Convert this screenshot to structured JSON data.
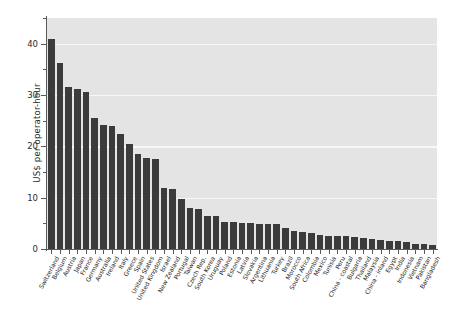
{
  "chart_data": {
    "type": "bar",
    "title": "",
    "subtitle": "",
    "xlabel": "",
    "ylabel": "US$ per operator-hour",
    "ylim": [
      0,
      45
    ],
    "yticks": [
      0,
      10,
      20,
      30,
      40
    ],
    "ytick_labels": [
      "0",
      "10",
      "20",
      "30",
      "40"
    ],
    "yminor_ticks": [
      5,
      15,
      25,
      35,
      45
    ],
    "gridlines": [
      10,
      20,
      30,
      40
    ],
    "grid": true,
    "legend": null,
    "bar_color": "#3b3b3b",
    "plot_background": "#e4e4e4",
    "gridline_color": "#f7f7f7",
    "categories": [
      "Switzerland",
      "Belgium",
      "Austria",
      "Japan",
      "France",
      "Germany",
      "Australia",
      "Ireland",
      "Italy",
      "Greece",
      "Spain",
      "United States",
      "United Kingdom",
      "Israel",
      "New Zealand",
      "Portugal",
      "Taiwan",
      "Czech Rep.",
      "South Korea",
      "Uruguay",
      "Poland",
      "Estonia",
      "Latvia",
      "Slovakia",
      "Argentina",
      "Lithuania",
      "Turkey",
      "Brazil",
      "Morocco",
      "South Africa",
      "Colombia",
      "Mexico",
      "Tunisia",
      "Peru",
      "China - coastal",
      "Bulgaria",
      "Thailand",
      "Malaysia",
      "China - inland",
      "Egypt",
      "India",
      "Indonesia",
      "Vietnam",
      "Pakistan",
      "Bangladesh"
    ],
    "values": [
      41.0,
      36.3,
      31.5,
      31.1,
      30.6,
      25.5,
      24.1,
      24.0,
      22.5,
      20.4,
      18.5,
      17.8,
      17.5,
      11.8,
      11.7,
      9.8,
      8.0,
      7.7,
      6.5,
      6.4,
      5.2,
      5.2,
      5.1,
      5.0,
      4.9,
      4.8,
      4.8,
      4.0,
      3.6,
      3.3,
      3.2,
      2.7,
      2.6,
      2.6,
      2.5,
      2.4,
      2.2,
      2.0,
      1.8,
      1.6,
      1.5,
      1.4,
      1.0,
      0.9,
      0.7
    ]
  }
}
